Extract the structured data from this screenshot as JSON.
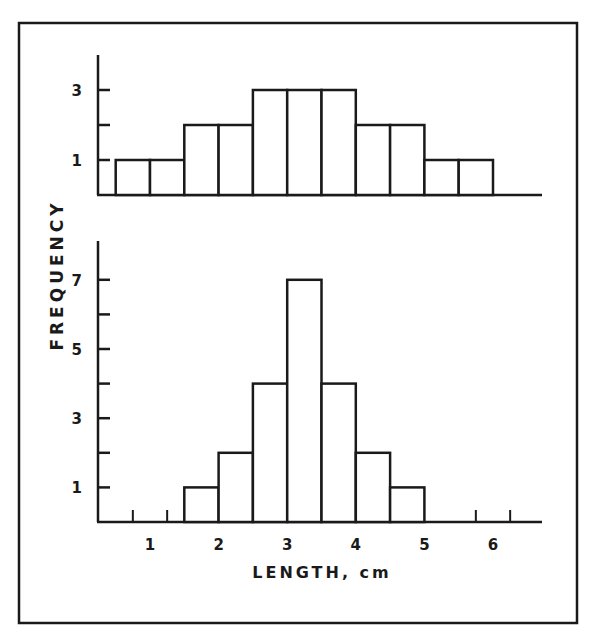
{
  "chart_data": [
    {
      "type": "bar",
      "subtype": "histogram",
      "panel": "top",
      "title": "",
      "xlabel": "LENGTH, cm",
      "ylabel": "FREQUENCY",
      "bin_width": 0.5,
      "bins": [
        {
          "x0": 0.5,
          "x1": 1.0,
          "value": 1
        },
        {
          "x0": 1.0,
          "x1": 1.5,
          "value": 1
        },
        {
          "x0": 1.5,
          "x1": 2.0,
          "value": 2
        },
        {
          "x0": 2.0,
          "x1": 2.5,
          "value": 2
        },
        {
          "x0": 2.5,
          "x1": 3.0,
          "value": 3
        },
        {
          "x0": 3.0,
          "x1": 3.5,
          "value": 3
        },
        {
          "x0": 3.5,
          "x1": 4.0,
          "value": 3
        },
        {
          "x0": 4.0,
          "x1": 4.5,
          "value": 2
        },
        {
          "x0": 4.5,
          "x1": 5.0,
          "value": 2
        },
        {
          "x0": 5.0,
          "x1": 5.5,
          "value": 1
        },
        {
          "x0": 5.5,
          "x1": 6.0,
          "value": 1
        }
      ],
      "categories": [
        "0.5-1.0",
        "1.0-1.5",
        "1.5-2.0",
        "2.0-2.5",
        "2.5-3.0",
        "3.0-3.5",
        "3.5-4.0",
        "4.0-4.5",
        "4.5-5.0",
        "5.0-5.5",
        "5.5-6.0"
      ],
      "values": [
        1,
        1,
        2,
        2,
        3,
        3,
        3,
        2,
        2,
        1,
        1
      ],
      "ylim": [
        0,
        4
      ],
      "y_ticks": [
        1,
        2,
        3
      ],
      "y_tick_labels": [
        "1",
        "",
        "3"
      ],
      "grid": false,
      "legend": null
    },
    {
      "type": "bar",
      "subtype": "histogram",
      "panel": "bottom",
      "title": "",
      "xlabel": "LENGTH, cm",
      "ylabel": "FREQUENCY",
      "bin_width": 0.5,
      "bins": [
        {
          "x0": 1.5,
          "x1": 2.0,
          "value": 1
        },
        {
          "x0": 2.0,
          "x1": 2.5,
          "value": 2
        },
        {
          "x0": 2.5,
          "x1": 3.0,
          "value": 4
        },
        {
          "x0": 3.0,
          "x1": 3.5,
          "value": 7
        },
        {
          "x0": 3.5,
          "x1": 4.0,
          "value": 4
        },
        {
          "x0": 4.0,
          "x1": 4.5,
          "value": 2
        },
        {
          "x0": 4.5,
          "x1": 5.0,
          "value": 1
        }
      ],
      "categories": [
        "1.5-2.0",
        "2.0-2.5",
        "2.5-3.0",
        "3.0-3.5",
        "3.5-4.0",
        "4.0-4.5",
        "4.5-5.0"
      ],
      "values": [
        1,
        2,
        4,
        7,
        4,
        2,
        1
      ],
      "ylim": [
        0,
        8
      ],
      "y_ticks": [
        1,
        2,
        3,
        4,
        5,
        6,
        7
      ],
      "y_tick_labels": [
        "1",
        "",
        "3",
        "",
        "5",
        "",
        "7"
      ],
      "x_ticks": [
        1,
        2,
        3,
        4,
        5,
        6
      ],
      "x_tick_labels": [
        "1",
        "2",
        "3",
        "4",
        "5",
        "6"
      ],
      "grid": false,
      "legend": null
    }
  ],
  "labels": {
    "ylabel": "FREQUENCY",
    "xlabel": "LENGTH, cm"
  },
  "style": {
    "ink": "#1a1a1a",
    "background": "#ffffff"
  }
}
